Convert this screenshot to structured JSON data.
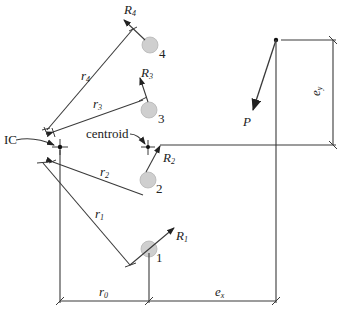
{
  "labels": {
    "ic": "IC",
    "centroid": "centroid",
    "load": "P",
    "ex": "e",
    "ex_sub": "x",
    "ey": "e",
    "ey_sub": "y",
    "r0": "r",
    "r0_sub": "0",
    "r1": "r",
    "r1_sub": "1",
    "r2": "r",
    "r2_sub": "2",
    "r3": "r",
    "r3_sub": "3",
    "r4": "r",
    "r4_sub": "4",
    "R1": "R",
    "R1_sub": "1",
    "R2": "R",
    "R2_sub": "2",
    "R3": "R",
    "R3_sub": "3",
    "R4": "R",
    "R4_sub": "4"
  },
  "bolts": [
    {
      "number": "1"
    },
    {
      "number": "2"
    },
    {
      "number": "3"
    },
    {
      "number": "4"
    }
  ],
  "colors": {
    "line": "#3a3a3a",
    "bolt_fill": "#cfcfcf"
  }
}
